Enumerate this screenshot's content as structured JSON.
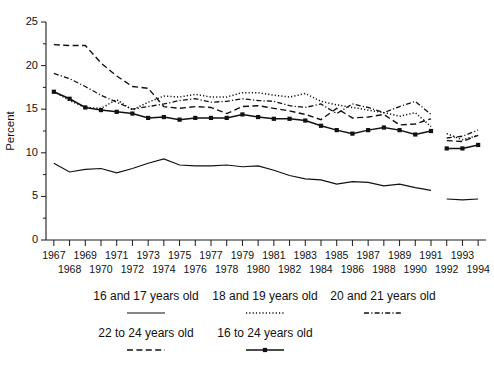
{
  "chart_data": {
    "type": "line",
    "title": "",
    "xlabel": "",
    "ylabel": "Percent",
    "ylim": [
      0,
      25
    ],
    "yticks": [
      0,
      5,
      10,
      15,
      20,
      25
    ],
    "ytick_labels": [
      "0",
      "5",
      "10",
      "15",
      "20",
      "25"
    ],
    "grid": false,
    "legend_position": "below",
    "x": [
      1967,
      1968,
      1969,
      1970,
      1971,
      1972,
      1973,
      1974,
      1975,
      1976,
      1977,
      1978,
      1979,
      1980,
      1981,
      1982,
      1983,
      1984,
      1985,
      1986,
      1987,
      1988,
      1989,
      1990,
      1991,
      1992,
      1993,
      1994
    ],
    "xtick_labels_row1": [
      "1967",
      "",
      "1969",
      "",
      "1971",
      "",
      "1973",
      "",
      "1975",
      "",
      "1977",
      "",
      "1979",
      "",
      "1981",
      "",
      "1983",
      "",
      "1985",
      "",
      "1987",
      "",
      "1989",
      "",
      "1991",
      "",
      "1993",
      ""
    ],
    "xtick_labels_row2": [
      "",
      "1968",
      "",
      "1970",
      "",
      "1972",
      "",
      "1974",
      "",
      "1976",
      "",
      "1978",
      "",
      "1980",
      "",
      "1982",
      "",
      "1984",
      "",
      "1986",
      "",
      "1988",
      "",
      "1990",
      "",
      "1992",
      "",
      "1994"
    ],
    "series_break_after": 1991,
    "series": [
      {
        "name": "16 and 17 years old",
        "style": "solid",
        "marker": "none",
        "values": [
          8.8,
          7.8,
          8.1,
          8.2,
          7.7,
          8.2,
          8.8,
          9.3,
          8.6,
          8.5,
          8.5,
          8.6,
          8.4,
          8.5,
          8.0,
          7.4,
          7.0,
          6.9,
          6.4,
          6.7,
          6.6,
          6.2,
          6.4,
          6.0,
          5.7,
          4.7,
          4.6,
          4.7
        ]
      },
      {
        "name": "18 and 19 years old",
        "style": "dotted",
        "marker": "none",
        "values": [
          17.0,
          16.0,
          15.2,
          15.1,
          16.1,
          14.9,
          15.8,
          16.5,
          16.4,
          16.7,
          16.4,
          16.4,
          16.9,
          16.9,
          16.6,
          16.4,
          16.8,
          15.9,
          15.5,
          15.2,
          14.9,
          14.6,
          14.2,
          14.6,
          13.0,
          12.2,
          11.5,
          12.0
        ]
      },
      {
        "name": "20 and 21 years old",
        "style": "dashdot",
        "marker": "none",
        "values": [
          19.1,
          18.5,
          17.6,
          16.6,
          15.8,
          15.0,
          15.3,
          15.6,
          16.0,
          16.2,
          15.8,
          15.9,
          16.2,
          16.0,
          15.9,
          15.4,
          15.2,
          15.6,
          14.5,
          15.6,
          15.2,
          14.6,
          15.3,
          15.9,
          14.4,
          11.7,
          11.9,
          12.6
        ]
      },
      {
        "name": "22 to 24 years old",
        "style": "dashed",
        "marker": "none",
        "values": [
          22.4,
          22.3,
          22.3,
          20.3,
          18.8,
          17.6,
          17.4,
          15.3,
          15.1,
          15.3,
          15.2,
          14.5,
          15.3,
          15.4,
          15.1,
          14.8,
          14.4,
          13.8,
          15.1,
          14.0,
          14.1,
          14.4,
          13.2,
          13.3,
          13.9,
          11.4,
          11.3,
          12.0
        ]
      },
      {
        "name": "16 to 24 years old",
        "style": "solid-marker",
        "marker": "square",
        "values": [
          17.0,
          16.2,
          15.2,
          14.9,
          14.7,
          14.5,
          14.0,
          14.1,
          13.8,
          14.0,
          14.0,
          14.0,
          14.4,
          14.1,
          13.9,
          13.9,
          13.7,
          13.1,
          12.6,
          12.2,
          12.6,
          12.9,
          12.6,
          12.1,
          12.5,
          10.5,
          10.5,
          10.9
        ]
      }
    ]
  },
  "legend": {
    "rows": [
      [
        {
          "label": "16 and 17 years old",
          "style": "solid"
        },
        {
          "label": "18 and 19 years old",
          "style": "dotted"
        },
        {
          "label": "20 and 21 years old",
          "style": "dashdot"
        }
      ],
      [
        {
          "label": "22 to 24 years old",
          "style": "dashed"
        },
        {
          "label": "16 to 24 years old",
          "style": "solid-marker"
        }
      ]
    ]
  }
}
